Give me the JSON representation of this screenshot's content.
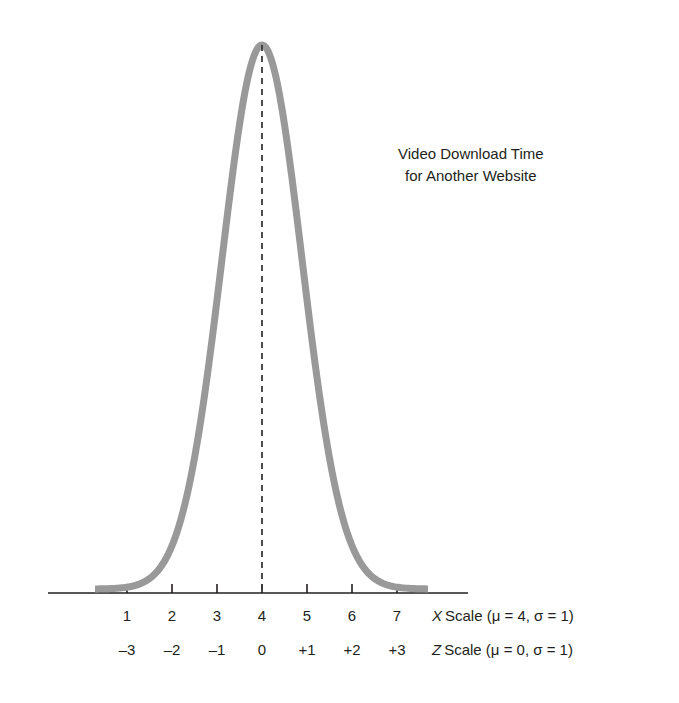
{
  "chart_data": {
    "type": "line",
    "title": "",
    "annotation": {
      "line1": "Video Download Time",
      "line2": "for Another Website"
    },
    "curve": {
      "distribution": "normal",
      "mean": 4,
      "sigma": 1,
      "description": "bell-shaped normal curve centred on X = 4 / Z = 0",
      "color": "#999999",
      "line_width": 7
    },
    "center_line": {
      "at_x": 4,
      "at_z": 0,
      "style": "dashed",
      "color": "#3a3a3a"
    },
    "axes": [
      {
        "name": "X Scale",
        "label": "X Scale (μ = 4, σ = 1)",
        "variable": "X",
        "caption_rest": "Scale (μ = 4, σ = 1)",
        "mu": 4,
        "sigma": 1,
        "ticks": [
          "1",
          "2",
          "3",
          "4",
          "5",
          "6",
          "7"
        ],
        "tick_values": [
          1,
          2,
          3,
          4,
          5,
          6,
          7
        ]
      },
      {
        "name": "Z Scale",
        "label": "Z Scale (μ = 0, σ = 1)",
        "variable": "Z",
        "caption_rest": "Scale (μ = 0, σ = 1)",
        "mu": 0,
        "sigma": 1,
        "ticks": [
          "–3",
          "–2",
          "–1",
          "0",
          "+1",
          "+2",
          "+3"
        ],
        "tick_values": [
          -3,
          -2,
          -1,
          0,
          1,
          2,
          3
        ]
      }
    ],
    "xlabel": "",
    "ylabel": "",
    "grid": false,
    "legend": "none"
  },
  "geometry": {
    "axis_y": 593,
    "axis_x_start": 48,
    "axis_x_end": 468,
    "tick_spacing_px": 45,
    "center_px": 262,
    "peak_px_y": 45,
    "sigma_px": 40
  }
}
